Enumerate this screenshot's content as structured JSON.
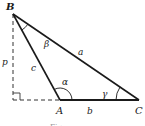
{
  "diagram": {
    "type": "oblique-triangle",
    "vertices": {
      "A": {
        "label": "A",
        "x": 60,
        "y": 100
      },
      "B": {
        "label": "B",
        "x": 13,
        "y": 14
      },
      "C": {
        "label": "C",
        "x": 139,
        "y": 100
      }
    },
    "foot": {
      "x": 13,
      "y": 100
    },
    "sides": {
      "a": "a",
      "b": "b",
      "c": "c",
      "p": "p"
    },
    "angles": {
      "alpha": "α",
      "beta": "β",
      "gamma": "γ"
    },
    "caption": "Figure"
  },
  "colors": {
    "stroke": "#1a1a1a",
    "dashed": "#333333",
    "background": "#ffffff"
  }
}
